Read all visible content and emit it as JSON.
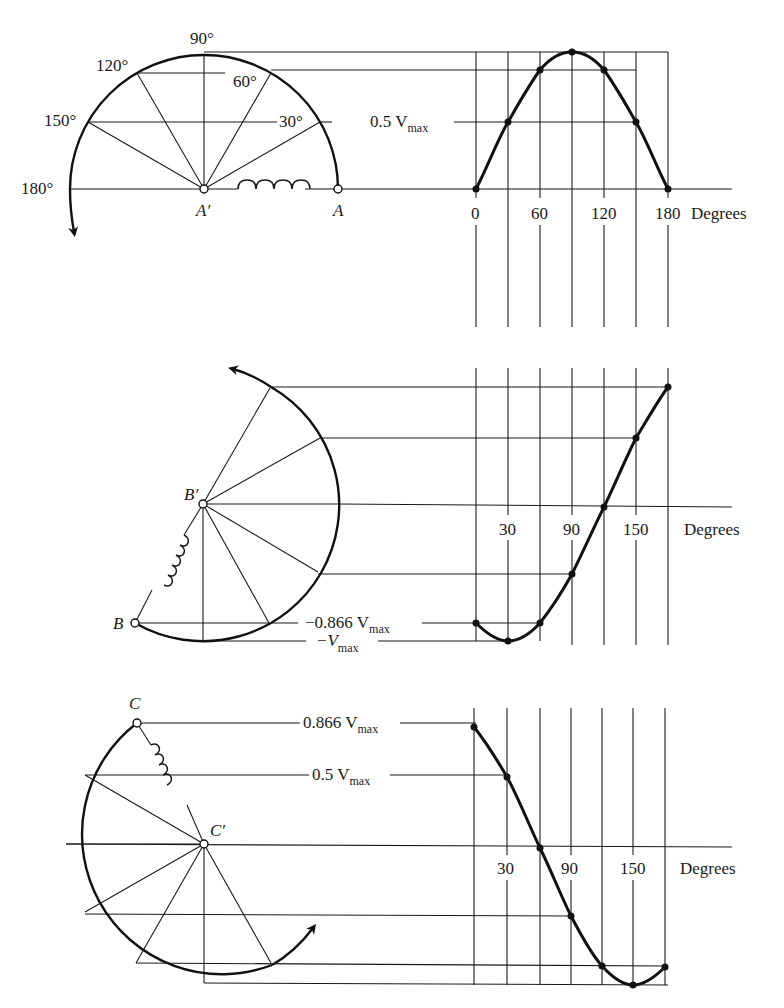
{
  "top": {
    "angle_labels": [
      "90°",
      "120°",
      "60°",
      "150°",
      "30°",
      "180°"
    ],
    "node_center": "A′",
    "node_end": "A",
    "ref_label": "0.5 V",
    "ref_sub": "max",
    "x_ticks": [
      "0",
      "60",
      "120",
      "180"
    ],
    "x_unit": "Degrees"
  },
  "middle": {
    "node_center": "B′",
    "node_end": "B",
    "ref1_label": "−0.866 V",
    "ref1_sub": "max",
    "ref2_label": "−V",
    "ref2_sub": "max",
    "x_ticks": [
      "30",
      "90",
      "150"
    ],
    "x_unit": "Degrees"
  },
  "bottom": {
    "node_center": "C′",
    "node_end": "C",
    "ref1_label": "0.866 V",
    "ref1_sub": "max",
    "ref2_label": "0.5 V",
    "ref2_sub": "max",
    "x_ticks": [
      "30",
      "90",
      "150"
    ],
    "x_unit": "Degrees"
  },
  "colors": {
    "ink": "#111111",
    "background": "#ffffff"
  }
}
